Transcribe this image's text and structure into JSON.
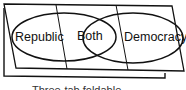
{
  "diagram": {
    "type": "three-tab foldable venn diagram",
    "labels": {
      "left": "Republic",
      "center": "Both",
      "right": "Democracy"
    },
    "caption": "Three-tab foldable"
  },
  "colors": {
    "stroke": "#111111",
    "background": "#ffffff"
  }
}
